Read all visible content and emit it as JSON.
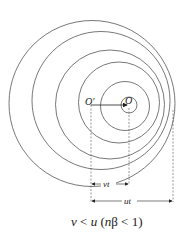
{
  "diagram": {
    "labels": {
      "o_prime": "O′",
      "o": "O",
      "vt": "vt",
      "ut": "ut"
    },
    "caption": {
      "v": "v",
      "lt1": " < ",
      "u": "u",
      "paren_open": " (",
      "n": "n",
      "rest": "β < 1)"
    },
    "colors": {
      "stroke": "#555555",
      "text": "#222222"
    }
  }
}
